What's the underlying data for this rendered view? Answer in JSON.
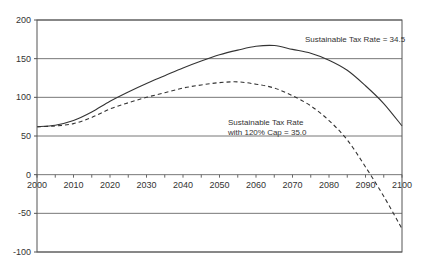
{
  "chart_data": {
    "type": "line",
    "title": "",
    "xlabel": "",
    "ylabel": "",
    "xlim": [
      2000,
      2100
    ],
    "ylim": [
      -100,
      200
    ],
    "x_ticks": [
      "2000",
      "2010",
      "2020",
      "2030",
      "2040",
      "2050",
      "2060",
      "2070",
      "2080",
      "2090",
      "2100"
    ],
    "y_ticks": [
      "200",
      "150",
      "100",
      "50",
      "0",
      "-50",
      "-100"
    ],
    "grid": true,
    "x": [
      2000,
      2005,
      2010,
      2015,
      2020,
      2025,
      2030,
      2035,
      2040,
      2045,
      2050,
      2055,
      2060,
      2065,
      2070,
      2075,
      2080,
      2085,
      2090,
      2095,
      2100
    ],
    "series": [
      {
        "name": "Sustainable Tax Rate = 34.5",
        "style": "solid",
        "values": [
          62,
          64,
          70,
          81,
          95,
          107,
          118,
          128,
          138,
          147,
          155,
          161,
          166,
          167,
          162,
          157,
          148,
          135,
          115,
          92,
          63
        ]
      },
      {
        "name": "Sustainable Tax Rate with 120% Cap = 35.0",
        "style": "dashed",
        "values": [
          62,
          63,
          66,
          74,
          85,
          93,
          100,
          106,
          112,
          116,
          119,
          120,
          117,
          112,
          102,
          89,
          70,
          45,
          10,
          -28,
          -70
        ]
      }
    ],
    "annotations": [
      {
        "text": "Sustainable Tax Rate = 34.5",
        "x": 2085,
        "y": 178
      },
      {
        "text_lines": [
          "Sustainable Tax Rate",
          "with 120% Cap = 35.0"
        ],
        "x": 2070,
        "y": 78
      }
    ],
    "legend": "none (inline annotations)"
  }
}
